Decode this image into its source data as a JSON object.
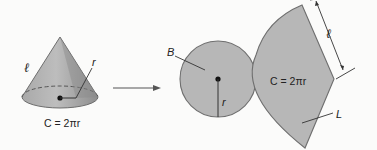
{
  "diagram": {
    "colors": {
      "background": "#fbfbfa",
      "fill": "#b7b7b7",
      "outline": "#6e6e6e",
      "ink": "#222222"
    },
    "cone": {
      "slant_label": "ℓ",
      "radius_label": "r",
      "circumference_label": "C = 2πr"
    },
    "arrow": {
      "direction": "right"
    },
    "base_circle": {
      "area_label": "B",
      "radius_label": "r"
    },
    "lateral_sector": {
      "slant_label": "ℓ",
      "arc_length_label": "C = 2πr",
      "area_label": "L"
    }
  }
}
